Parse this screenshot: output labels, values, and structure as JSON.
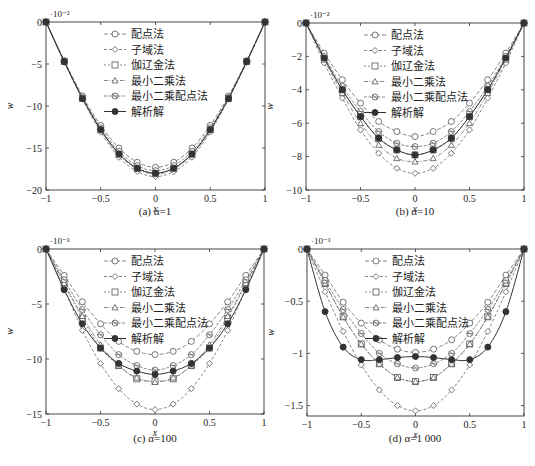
{
  "legend_labels": [
    "配点法",
    "子域法",
    "伽辽金法",
    "最小二乘法",
    "最小二乘配点法",
    "解析解"
  ],
  "chart_data": [
    {
      "id": "a",
      "type": "line",
      "caption": "(a) α=1",
      "xlabel": "x",
      "ylabel": "w",
      "y_multiplier": "·10⁻²",
      "xlim": [
        -1,
        1
      ],
      "ylim": [
        -20,
        0
      ],
      "xticks": [
        -1,
        -0.5,
        0,
        0.5,
        1
      ],
      "xtick_labels": [
        "−1",
        "−0.5",
        "0",
        "0.5",
        "1"
      ],
      "yticks": [
        0,
        -5,
        -10,
        -15,
        -20
      ],
      "ytick_labels": [
        "0",
        "−5",
        "−10",
        "−15",
        "−20"
      ],
      "grid": false,
      "legend_position": "upper-center",
      "x": [
        -1,
        -0.8333,
        -0.6667,
        -0.5,
        -0.3333,
        -0.1667,
        0,
        0.1667,
        0.3333,
        0.5,
        0.6667,
        0.8333,
        1
      ],
      "series": [
        {
          "name": "配点法",
          "marker": "circle",
          "values": [
            0,
            -4.6,
            -8.8,
            -12.3,
            -15.0,
            -16.7,
            -17.3,
            -16.7,
            -15.0,
            -12.3,
            -8.8,
            -4.6,
            0
          ]
        },
        {
          "name": "子域法",
          "marker": "diamond",
          "values": [
            0,
            -4.8,
            -9.2,
            -13.1,
            -16.1,
            -17.8,
            -18.4,
            -17.8,
            -16.1,
            -13.1,
            -9.2,
            -4.8,
            0
          ]
        },
        {
          "name": "伽辽金法",
          "marker": "square",
          "values": [
            0,
            -4.7,
            -9.1,
            -12.8,
            -15.7,
            -17.4,
            -18.0,
            -17.4,
            -15.7,
            -12.8,
            -9.1,
            -4.7,
            0
          ]
        },
        {
          "name": "最小二乘法",
          "marker": "triangle",
          "values": [
            0,
            -4.7,
            -9.1,
            -12.9,
            -15.8,
            -17.5,
            -18.1,
            -17.5,
            -15.8,
            -12.9,
            -9.1,
            -4.7,
            0
          ]
        },
        {
          "name": "最小二乘配点法",
          "marker": "circle-cross",
          "values": [
            0,
            -4.7,
            -9.0,
            -12.6,
            -15.4,
            -17.1,
            -17.7,
            -17.1,
            -15.4,
            -12.6,
            -9.0,
            -4.7,
            0
          ]
        },
        {
          "name": "解析解",
          "marker": "filled-circle",
          "values": [
            0,
            -4.7,
            -9.1,
            -12.8,
            -15.7,
            -17.4,
            -18.0,
            -17.4,
            -15.7,
            -12.8,
            -9.1,
            -4.7,
            0
          ]
        }
      ]
    },
    {
      "id": "b",
      "type": "line",
      "caption": "(b) α=10",
      "xlabel": "x",
      "ylabel": "w",
      "y_multiplier": "·10⁻²",
      "xlim": [
        -1,
        1
      ],
      "ylim": [
        -10,
        0
      ],
      "xticks": [
        -1,
        -0.5,
        0,
        0.5,
        1
      ],
      "xtick_labels": [
        "−1",
        "−0.5",
        "0",
        "0.5",
        "1"
      ],
      "yticks": [
        0,
        -2,
        -4,
        -6,
        -8,
        -10
      ],
      "ytick_labels": [
        "0",
        "−2",
        "−4",
        "−6",
        "−8",
        "−10"
      ],
      "grid": false,
      "legend_position": "upper-center",
      "x": [
        -1,
        -0.8333,
        -0.6667,
        -0.5,
        -0.3333,
        -0.1667,
        0,
        0.1667,
        0.3333,
        0.5,
        0.6667,
        0.8333,
        1
      ],
      "series": [
        {
          "name": "配点法",
          "marker": "circle",
          "values": [
            0,
            -1.8,
            -3.4,
            -4.8,
            -5.9,
            -6.5,
            -6.8,
            -6.5,
            -5.9,
            -4.8,
            -3.4,
            -1.8,
            0
          ]
        },
        {
          "name": "子域法",
          "marker": "diamond",
          "values": [
            0,
            -2.4,
            -4.5,
            -6.4,
            -7.8,
            -8.7,
            -9.0,
            -8.7,
            -7.8,
            -6.4,
            -4.5,
            -2.4,
            0
          ]
        },
        {
          "name": "伽辽金法",
          "marker": "square",
          "values": [
            0,
            -2.1,
            -4.0,
            -5.6,
            -6.9,
            -7.6,
            -7.9,
            -7.6,
            -6.9,
            -5.6,
            -4.0,
            -2.1,
            0
          ]
        },
        {
          "name": "最小二乘法",
          "marker": "triangle",
          "values": [
            0,
            -2.2,
            -4.2,
            -6.0,
            -7.3,
            -8.1,
            -8.3,
            -8.1,
            -7.3,
            -6.0,
            -4.2,
            -2.2,
            0
          ]
        },
        {
          "name": "最小二乘配点法",
          "marker": "circle-cross",
          "values": [
            0,
            -2.0,
            -3.8,
            -5.3,
            -6.5,
            -7.2,
            -7.4,
            -7.2,
            -6.5,
            -5.3,
            -3.8,
            -2.0,
            0
          ]
        },
        {
          "name": "解析解",
          "marker": "filled-circle",
          "values": [
            0,
            -2.1,
            -4.0,
            -5.6,
            -6.9,
            -7.6,
            -7.9,
            -7.6,
            -6.9,
            -5.6,
            -4.0,
            -2.1,
            0
          ]
        }
      ]
    },
    {
      "id": "c",
      "type": "line",
      "caption": "(c) α=100",
      "xlabel": "x",
      "ylabel": "w",
      "y_multiplier": "·10⁻³",
      "xlim": [
        -1,
        1
      ],
      "ylim": [
        -15,
        0
      ],
      "xticks": [
        -1,
        -0.5,
        0,
        0.5,
        1
      ],
      "xtick_labels": [
        "−1",
        "−0.5",
        "0",
        "0.5",
        "1"
      ],
      "yticks": [
        0,
        -5,
        -10,
        -15
      ],
      "ytick_labels": [
        "0",
        "−5",
        "−10",
        "−15"
      ],
      "grid": false,
      "legend_position": "upper-center",
      "x": [
        -1,
        -0.8333,
        -0.6667,
        -0.5,
        -0.3333,
        -0.1667,
        0,
        0.1667,
        0.3333,
        0.5,
        0.6667,
        0.8333,
        1
      ],
      "series": [
        {
          "name": "配点法",
          "marker": "circle",
          "values": [
            0,
            -2.4,
            -4.8,
            -6.8,
            -8.4,
            -9.3,
            -9.6,
            -9.3,
            -8.4,
            -6.8,
            -4.8,
            -2.4,
            0
          ]
        },
        {
          "name": "子域法",
          "marker": "diamond",
          "values": [
            0,
            -3.6,
            -7.4,
            -10.4,
            -12.7,
            -14.1,
            -14.6,
            -14.1,
            -12.7,
            -10.4,
            -7.4,
            -3.6,
            0
          ]
        },
        {
          "name": "伽辽金法",
          "marker": "square",
          "values": [
            0,
            -3.2,
            -6.3,
            -9.0,
            -10.6,
            -11.8,
            -12.0,
            -11.8,
            -10.6,
            -9.0,
            -6.3,
            -3.2,
            0
          ]
        },
        {
          "name": "最小二乘法",
          "marker": "triangle",
          "values": [
            0,
            -3.1,
            -6.1,
            -8.7,
            -10.6,
            -11.7,
            -12.1,
            -11.7,
            -10.6,
            -8.7,
            -6.1,
            -3.1,
            0
          ]
        },
        {
          "name": "最小二乘配点法",
          "marker": "circle-cross",
          "values": [
            0,
            -2.8,
            -5.5,
            -7.8,
            -9.6,
            -10.6,
            -11.0,
            -10.6,
            -9.6,
            -7.8,
            -5.5,
            -2.8,
            0
          ]
        },
        {
          "name": "解析解",
          "marker": "filled-circle",
          "values": [
            0,
            -3.7,
            -6.8,
            -9.0,
            -10.4,
            -11.1,
            -11.4,
            -11.1,
            -10.4,
            -9.0,
            -6.8,
            -3.7,
            0
          ]
        }
      ]
    },
    {
      "id": "d",
      "type": "line",
      "caption": "(d) α=1 000",
      "xlabel": "x",
      "ylabel": "w",
      "y_multiplier": "·10⁻³",
      "xlim": [
        -1,
        1
      ],
      "ylim": [
        -1.6,
        0
      ],
      "xticks": [
        -1,
        -0.5,
        0,
        0.5,
        1
      ],
      "xtick_labels": [
        "−1",
        "−0.5",
        "0",
        "0.5",
        "1"
      ],
      "yticks": [
        0,
        -0.5,
        -1,
        -1.5
      ],
      "ytick_labels": [
        "0",
        "−0.5",
        "−1",
        "−1.5"
      ],
      "grid": false,
      "legend_position": "upper-center",
      "x": [
        -1,
        -0.8333,
        -0.6667,
        -0.5,
        -0.3333,
        -0.1667,
        0,
        0.1667,
        0.3333,
        0.5,
        0.6667,
        0.8333,
        1
      ],
      "series": [
        {
          "name": "配点法",
          "marker": "circle",
          "values": [
            0,
            -0.25,
            -0.51,
            -0.71,
            -0.87,
            -0.96,
            -0.99,
            -0.96,
            -0.87,
            -0.71,
            -0.51,
            -0.25,
            0
          ]
        },
        {
          "name": "子域法",
          "marker": "diamond",
          "values": [
            0,
            -0.41,
            -0.79,
            -1.11,
            -1.35,
            -1.5,
            -1.55,
            -1.5,
            -1.35,
            -1.11,
            -0.79,
            -0.41,
            0
          ]
        },
        {
          "name": "伽辽金法",
          "marker": "square",
          "values": [
            0,
            -0.33,
            -0.65,
            -0.91,
            -1.1,
            -1.23,
            -1.27,
            -1.23,
            -1.1,
            -0.91,
            -0.65,
            -0.33,
            0
          ]
        },
        {
          "name": "最小二乘法",
          "marker": "triangle",
          "values": [
            0,
            -0.33,
            -0.65,
            -0.91,
            -1.1,
            -1.23,
            -1.27,
            -1.23,
            -1.1,
            -0.91,
            -0.65,
            -0.33,
            0
          ]
        },
        {
          "name": "最小二乘配点法",
          "marker": "circle-cross",
          "values": [
            0,
            -0.3,
            -0.58,
            -0.81,
            -1.0,
            -1.1,
            -1.14,
            -1.1,
            -1.0,
            -0.81,
            -0.58,
            -0.3,
            0
          ]
        },
        {
          "name": "解析解",
          "marker": "filled-circle",
          "values": [
            0,
            -0.6,
            -0.94,
            -1.06,
            -1.06,
            -1.04,
            -1.03,
            -1.04,
            -1.06,
            -1.06,
            -0.94,
            -0.6,
            0
          ]
        }
      ]
    }
  ],
  "layout": {
    "panels": [
      {
        "id": "a",
        "left": 46,
        "top": 22,
        "right": 265,
        "bottom": 190
      },
      {
        "id": "b",
        "left": 306,
        "top": 23,
        "right": 524,
        "bottom": 190
      },
      {
        "id": "c",
        "left": 46,
        "top": 249,
        "right": 264,
        "bottom": 414
      },
      {
        "id": "d",
        "left": 307,
        "top": 249,
        "right": 524,
        "bottom": 416
      }
    ],
    "colors": {
      "axis": "#333333",
      "line": "#555555",
      "marker_fill": "#ffffff",
      "filled": "#333333"
    }
  }
}
